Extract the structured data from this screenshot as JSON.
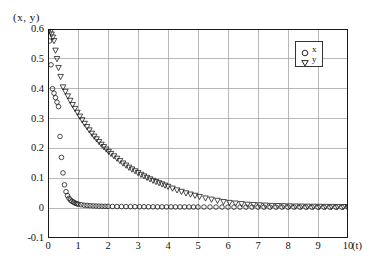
{
  "chart_data": {
    "type": "scatter",
    "title": "",
    "subtitle": "",
    "ylabel": "(x, y)",
    "xlabel": "(t)",
    "xlim": [
      0,
      10
    ],
    "ylim": [
      -0.1,
      0.6
    ],
    "xticks": [
      "0",
      "1",
      "2",
      "3",
      "4",
      "5",
      "6",
      "7",
      "8",
      "9",
      "10"
    ],
    "xtick_values": [
      0,
      1,
      2,
      3,
      4,
      5,
      6,
      7,
      8,
      9,
      10
    ],
    "yticks": [
      "0.6",
      "0.5",
      "0.4",
      "0.3",
      "0.2",
      "0.1",
      "0",
      "-0.1"
    ],
    "ytick_values": [
      0.6,
      0.5,
      0.4,
      0.3,
      0.2,
      0.1,
      0,
      -0.1
    ],
    "grid": true,
    "grid_color": "#9a9a9a",
    "axis_color": "#1a1a1a",
    "marker_color": "#111111",
    "legend_position": "top-right-inside",
    "legend": [
      {
        "name": "x",
        "marker": "circle-open"
      },
      {
        "name": "y",
        "marker": "triangle-down-open"
      }
    ],
    "series": [
      {
        "name": "x",
        "marker": "circle-open",
        "x": [
          0.0,
          0.05,
          0.1,
          0.15,
          0.2,
          0.25,
          0.3,
          0.35,
          0.4,
          0.45,
          0.5,
          0.55,
          0.6,
          0.65,
          0.7,
          0.75,
          0.8,
          0.85,
          0.9,
          0.95,
          1.0,
          1.1,
          1.2,
          1.3,
          1.4,
          1.5,
          1.6,
          1.7,
          1.8,
          1.9,
          2.0,
          2.15,
          2.3,
          2.45,
          2.6,
          2.75,
          2.9,
          3.05,
          3.2,
          3.35,
          3.5,
          3.65,
          3.8,
          3.95,
          4.1,
          4.25,
          4.4,
          4.55,
          4.7,
          4.85,
          5.0,
          5.2,
          5.4,
          5.6,
          5.8,
          6.0,
          6.2,
          6.4,
          6.6,
          6.8,
          7.0,
          7.2,
          7.4,
          7.6,
          7.8,
          8.0,
          8.2,
          8.4,
          8.6,
          8.8,
          9.0,
          9.2,
          9.4,
          9.6,
          9.8,
          10.0
        ],
        "y": [
          0.6,
          0.56,
          0.48,
          0.4,
          0.385,
          0.37,
          0.355,
          0.34,
          0.24,
          0.17,
          0.118,
          0.078,
          0.055,
          0.042,
          0.033,
          0.027,
          0.023,
          0.02,
          0.017,
          0.015,
          0.0135,
          0.0115,
          0.01,
          0.009,
          0.0082,
          0.0076,
          0.0071,
          0.0067,
          0.0064,
          0.0061,
          0.0059,
          0.0056,
          0.0054,
          0.0052,
          0.005,
          0.0049,
          0.0048,
          0.0047,
          0.0046,
          0.0045,
          0.0044,
          0.0043,
          0.0042,
          0.0042,
          0.0041,
          0.0041,
          0.004,
          0.004,
          0.0039,
          0.0039,
          0.0038,
          0.0038,
          0.0037,
          0.0037,
          0.0036,
          0.0036,
          0.0035,
          0.0035,
          0.0035,
          0.0034,
          0.0034,
          0.0034,
          0.0033,
          0.0033,
          0.0033,
          0.0032,
          0.0032,
          0.0032,
          0.0031,
          0.0031,
          0.0031,
          0.003,
          0.003,
          0.003,
          0.0029,
          0.0029
        ]
      },
      {
        "name": "y",
        "marker": "triangle-down-open",
        "x": [
          0.0,
          0.04,
          0.08,
          0.12,
          0.16,
          0.2,
          0.25,
          0.3,
          0.35,
          0.42,
          0.5,
          0.58,
          0.66,
          0.74,
          0.82,
          0.9,
          0.98,
          1.06,
          1.14,
          1.22,
          1.3,
          1.38,
          1.46,
          1.54,
          1.62,
          1.7,
          1.78,
          1.86,
          1.94,
          2.02,
          2.1,
          2.2,
          2.3,
          2.4,
          2.5,
          2.6,
          2.7,
          2.8,
          2.9,
          3.0,
          3.1,
          3.2,
          3.3,
          3.4,
          3.5,
          3.6,
          3.7,
          3.8,
          3.9,
          4.0,
          4.15,
          4.3,
          4.45,
          4.6,
          4.75,
          4.9,
          5.05,
          5.25,
          5.45,
          5.65,
          5.85,
          6.05,
          6.25,
          6.45,
          6.65,
          6.85,
          7.05,
          7.25,
          7.45,
          7.65,
          7.85,
          8.05,
          8.25,
          8.45,
          8.65,
          8.85,
          9.05,
          9.25,
          9.45,
          9.65,
          9.85,
          10.0
        ],
        "y": [
          0.6,
          0.596,
          0.59,
          0.582,
          0.572,
          0.56,
          0.528,
          0.5,
          0.47,
          0.44,
          0.405,
          0.39,
          0.375,
          0.36,
          0.346,
          0.333,
          0.32,
          0.307,
          0.295,
          0.283,
          0.272,
          0.261,
          0.25,
          0.24,
          0.231,
          0.222,
          0.213,
          0.205,
          0.197,
          0.189,
          0.182,
          0.174,
          0.166,
          0.158,
          0.15,
          0.143,
          0.136,
          0.13,
          0.124,
          0.118,
          0.112,
          0.107,
          0.102,
          0.097,
          0.092,
          0.088,
          0.084,
          0.08,
          0.076,
          0.072,
          0.066,
          0.06,
          0.055,
          0.05,
          0.046,
          0.042,
          0.038,
          0.033,
          0.029,
          0.025,
          0.021,
          0.018,
          0.016,
          0.014,
          0.012,
          0.011,
          0.01,
          0.009,
          0.008,
          0.0075,
          0.007,
          0.0065,
          0.006,
          0.0058,
          0.0055,
          0.0052,
          0.005,
          0.0048,
          0.0046,
          0.0044,
          0.0042,
          0.004
        ]
      }
    ]
  }
}
